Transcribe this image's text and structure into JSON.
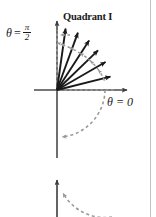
{
  "figure": {
    "title": "Quadrant I",
    "axis_labels": {
      "vertical": {
        "theta": "θ",
        "equals": "=",
        "numerator": "π",
        "denominator": "2",
        "full": "θ = π/2"
      },
      "horizontal": {
        "full": "θ = 0"
      }
    },
    "colors": {
      "vector": "#1a1a1a",
      "axis": "#4a4a4a",
      "dashed": "#9a9a9a",
      "text": "#1a1a1a",
      "page_border": "#b8b8b8",
      "background": "#ffffff"
    },
    "origin": {
      "x": 57,
      "y": 90
    },
    "vectors": [
      {
        "name": "vector-1",
        "angle_deg": 82,
        "length": 62
      },
      {
        "name": "vector-2",
        "angle_deg": 70,
        "length": 61
      },
      {
        "name": "vector-3",
        "angle_deg": 57,
        "length": 59
      },
      {
        "name": "vector-4",
        "angle_deg": 44,
        "length": 57
      },
      {
        "name": "vector-5",
        "angle_deg": 30,
        "length": 56
      },
      {
        "name": "vector-6",
        "angle_deg": 14,
        "length": 55
      }
    ],
    "dashed_arc_upper": {
      "name": "rotation-arc-quadrant-i",
      "radius": 48,
      "start_angle_deg": 8,
      "end_angle_deg": 90,
      "direction": "counterclockwise"
    },
    "dashed_arc_lower": {
      "name": "rotation-arc-fourth-quadrant",
      "radius": 48,
      "start_angle_deg": 0,
      "end_angle_deg": -90,
      "direction": "clockwise"
    },
    "second_figure": {
      "name": "cropped-lower-figure",
      "axis_top_y": 176,
      "arc_present": true
    },
    "axes": {
      "vertical_x": 57,
      "vertical_top_y": 17,
      "vertical_bottom_y": 158,
      "horizontal_y": 90,
      "horizontal_left_x": 34,
      "horizontal_right_x": 131
    }
  }
}
